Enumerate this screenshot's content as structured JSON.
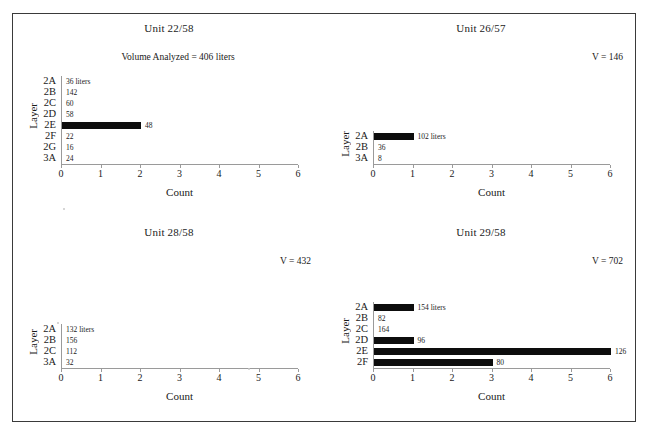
{
  "figure": {
    "axis_x_label": "Count",
    "axis_y_label": "Layer",
    "x_min": 0,
    "x_max": 6,
    "x_ticks": [
      "0",
      "1",
      "2",
      "3",
      "4",
      "5",
      "6"
    ]
  },
  "chart_data": [
    {
      "type": "bar",
      "orientation": "horizontal",
      "title": "Unit 22/58",
      "annotation": "Volume Analyzed = 406 liters",
      "xlabel": "Count",
      "ylabel": "Layer",
      "xlim": [
        0,
        6
      ],
      "xticks": [
        0,
        1,
        2,
        3,
        4,
        5,
        6
      ],
      "grid": false,
      "legend": "none",
      "categories": [
        "2A",
        "2B",
        "2C",
        "2D",
        "2E",
        "2F",
        "2G",
        "3A"
      ],
      "values": [
        0,
        0,
        0,
        0,
        2,
        0,
        0,
        0
      ],
      "point_labels": [
        "36 liters",
        "142",
        "60",
        "58",
        "48",
        "22",
        "16",
        "24"
      ]
    },
    {
      "type": "bar",
      "orientation": "horizontal",
      "title": "Unit 26/57",
      "annotation": "V = 146",
      "xlabel": "Count",
      "ylabel": "Layer",
      "xlim": [
        0,
        6
      ],
      "xticks": [
        0,
        1,
        2,
        3,
        4,
        5,
        6
      ],
      "grid": false,
      "legend": "none",
      "categories": [
        "2A",
        "2B",
        "3A"
      ],
      "values": [
        1,
        0,
        0
      ],
      "point_labels": [
        "102 liters",
        "36",
        "8"
      ]
    },
    {
      "type": "bar",
      "orientation": "horizontal",
      "title": "Unit 28/58",
      "annotation": "V = 432",
      "xlabel": "Count",
      "ylabel": "Layer",
      "xlim": [
        0,
        6
      ],
      "xticks": [
        0,
        1,
        2,
        3,
        4,
        5,
        6
      ],
      "grid": false,
      "legend": "none",
      "categories": [
        "2A",
        "2B",
        "2C",
        "3A"
      ],
      "values": [
        0,
        0,
        0,
        0
      ],
      "point_labels": [
        "132 liters",
        "156",
        "112",
        "32"
      ]
    },
    {
      "type": "bar",
      "orientation": "horizontal",
      "title": "Unit 29/58",
      "annotation": "V = 702",
      "xlabel": "Count",
      "ylabel": "Layer",
      "xlim": [
        0,
        6
      ],
      "xticks": [
        0,
        1,
        2,
        3,
        4,
        5,
        6
      ],
      "grid": false,
      "legend": "none",
      "categories": [
        "2A",
        "2B",
        "2C",
        "2D",
        "2E",
        "2F"
      ],
      "values": [
        1,
        0,
        0,
        1,
        6,
        3
      ],
      "point_labels": [
        "154 liters",
        "82",
        "164",
        "96",
        "126",
        "80"
      ]
    }
  ]
}
